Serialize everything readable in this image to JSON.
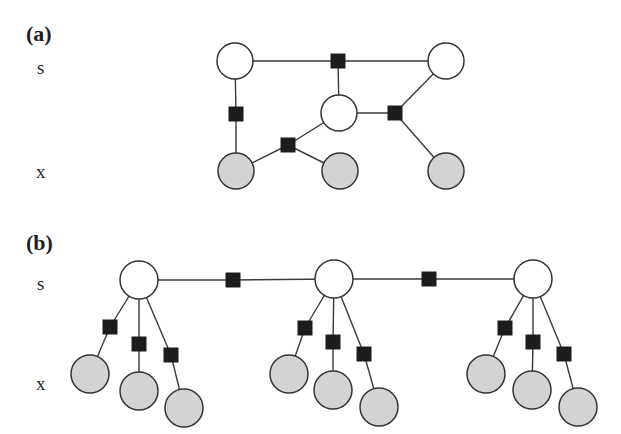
{
  "colors": {
    "background": "#ffffff",
    "hidden_node_fill": "#ffffff",
    "observed_node_fill": "#d3d3d3",
    "node_stroke": "#333333",
    "factor_fill": "#1c1c1c",
    "edge": "#3a3a3a"
  },
  "panels": [
    {
      "id": "a",
      "label": "(a)",
      "label_pos": [
        26,
        23
      ],
      "row_labels": [
        {
          "text": "s",
          "pos": [
            37,
            58
          ]
        },
        {
          "text": "x",
          "pos": [
            36,
            162
          ]
        }
      ],
      "node_radius": 18,
      "hidden_nodes": [
        {
          "id": "s1",
          "x": 235,
          "y": 61
        },
        {
          "id": "s2",
          "x": 446,
          "y": 61
        },
        {
          "id": "s3",
          "x": 339,
          "y": 113
        }
      ],
      "observed_nodes": [
        {
          "id": "x1",
          "x": 236,
          "y": 171
        },
        {
          "id": "x2",
          "x": 340,
          "y": 171
        },
        {
          "id": "x3",
          "x": 446,
          "y": 171
        }
      ],
      "factors": [
        {
          "id": "f1",
          "x": 338,
          "y": 61
        },
        {
          "id": "f2",
          "x": 236,
          "y": 114
        },
        {
          "id": "f3",
          "x": 288,
          "y": 145
        },
        {
          "id": "f4",
          "x": 395,
          "y": 113
        }
      ],
      "edges": [
        [
          "s1",
          "f1"
        ],
        [
          "f1",
          "s2"
        ],
        [
          "f1",
          "s3"
        ],
        [
          "s1",
          "f2"
        ],
        [
          "f2",
          "x1"
        ],
        [
          "x1",
          "f3"
        ],
        [
          "f3",
          "s3"
        ],
        [
          "f3",
          "x2"
        ],
        [
          "s3",
          "f4"
        ],
        [
          "s2",
          "f4"
        ],
        [
          "f4",
          "x3"
        ]
      ]
    },
    {
      "id": "b",
      "label": "(b)",
      "label_pos": [
        26,
        232
      ],
      "row_labels": [
        {
          "text": "s",
          "pos": [
            37,
            274
          ]
        },
        {
          "text": "x",
          "pos": [
            36,
            374
          ]
        }
      ],
      "node_radius": 19,
      "hidden_nodes": [
        {
          "id": "s1",
          "x": 139,
          "y": 280
        },
        {
          "id": "s2",
          "x": 334,
          "y": 279
        },
        {
          "id": "s3",
          "x": 533,
          "y": 279
        }
      ],
      "observed_nodes": [
        {
          "id": "x11",
          "x": 90,
          "y": 374
        },
        {
          "id": "x12",
          "x": 139,
          "y": 391
        },
        {
          "id": "x13",
          "x": 184,
          "y": 408
        },
        {
          "id": "x21",
          "x": 289,
          "y": 374
        },
        {
          "id": "x22",
          "x": 333,
          "y": 390
        },
        {
          "id": "x23",
          "x": 379,
          "y": 407
        },
        {
          "id": "x31",
          "x": 486,
          "y": 374
        },
        {
          "id": "x32",
          "x": 532,
          "y": 390
        },
        {
          "id": "x33",
          "x": 578,
          "y": 407
        }
      ],
      "factors": [
        {
          "id": "h1",
          "x": 233,
          "y": 280
        },
        {
          "id": "h2",
          "x": 429,
          "y": 279
        },
        {
          "id": "f11",
          "x": 110,
          "y": 327
        },
        {
          "id": "f12",
          "x": 139,
          "y": 344
        },
        {
          "id": "f13",
          "x": 171,
          "y": 355
        },
        {
          "id": "f21",
          "x": 305,
          "y": 328
        },
        {
          "id": "f22",
          "x": 333,
          "y": 342
        },
        {
          "id": "f23",
          "x": 364,
          "y": 354
        },
        {
          "id": "f31",
          "x": 505,
          "y": 328
        },
        {
          "id": "f32",
          "x": 533,
          "y": 342
        },
        {
          "id": "f33",
          "x": 564,
          "y": 354
        }
      ],
      "edges": [
        [
          "s1",
          "h1"
        ],
        [
          "h1",
          "s2"
        ],
        [
          "s2",
          "h2"
        ],
        [
          "h2",
          "s3"
        ],
        [
          "s1",
          "f11"
        ],
        [
          "f11",
          "x11"
        ],
        [
          "s1",
          "f12"
        ],
        [
          "f12",
          "x12"
        ],
        [
          "s1",
          "f13"
        ],
        [
          "f13",
          "x13"
        ],
        [
          "s2",
          "f21"
        ],
        [
          "f21",
          "x21"
        ],
        [
          "s2",
          "f22"
        ],
        [
          "f22",
          "x22"
        ],
        [
          "s2",
          "f23"
        ],
        [
          "f23",
          "x23"
        ],
        [
          "s3",
          "f31"
        ],
        [
          "f31",
          "x31"
        ],
        [
          "s3",
          "f32"
        ],
        [
          "f32",
          "x32"
        ],
        [
          "s3",
          "f33"
        ],
        [
          "f33",
          "x33"
        ]
      ]
    }
  ],
  "factor_size": 14
}
